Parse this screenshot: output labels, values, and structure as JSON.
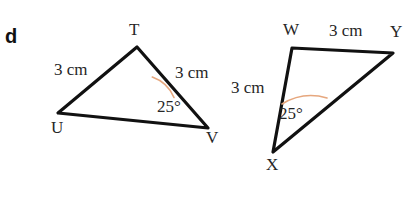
{
  "figure": {
    "part_label": "d",
    "background_color": "#ffffff",
    "stroke_color": "#111111",
    "arc_color": "#e6a77e",
    "text_color": "#262626",
    "triangles": [
      {
        "name": "triangle-TUV",
        "vertices": [
          {
            "label": "T",
            "x": 137,
            "y": 47
          },
          {
            "label": "U",
            "x": 58,
            "y": 113
          },
          {
            "label": "V",
            "x": 208,
            "y": 128
          }
        ],
        "side_labels": [
          {
            "name": "side-TU-length",
            "text": "3 cm"
          },
          {
            "name": "side-TV-length",
            "text": "3 cm"
          }
        ],
        "angle": {
          "at": "V",
          "text": "25°",
          "value": 25
        }
      },
      {
        "name": "triangle-WXY",
        "vertices": [
          {
            "label": "W",
            "x": 292,
            "y": 48
          },
          {
            "label": "Y",
            "x": 393,
            "y": 53
          },
          {
            "label": "X",
            "x": 273,
            "y": 152
          }
        ],
        "side_labels": [
          {
            "name": "side-WY-length",
            "text": "3 cm"
          },
          {
            "name": "side-WX-length",
            "text": "3 cm"
          }
        ],
        "angle": {
          "at": "X",
          "text": "25°",
          "value": 25
        }
      }
    ]
  }
}
